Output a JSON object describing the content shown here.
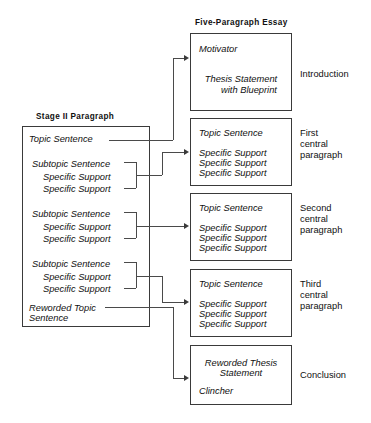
{
  "diagram": {
    "title_left": "Stage II Paragraph",
    "title_right": "Five-Paragraph Essay"
  },
  "stage_paragraph": {
    "topic_sentence": "Topic Sentence",
    "groups": [
      {
        "subtopic": "Subtopic Sentence",
        "support_1": "Specific Support",
        "support_2": "Specific Support"
      },
      {
        "subtopic": "Subtopic Sentence",
        "support_1": "Specific Support",
        "support_2": "Specific Support"
      },
      {
        "subtopic": "Subtopic Sentence",
        "support_1": "Specific Support",
        "support_2": "Specific Support"
      }
    ],
    "reworded_line_1": "Reworded Topic",
    "reworded_line_2": "Sentence"
  },
  "essay": {
    "boxes": [
      {
        "line_1": "Motivator",
        "line_2": "Thesis Statement",
        "line_3": "with Blueprint",
        "label": "Introduction"
      },
      {
        "line_1": "Topic Sentence",
        "line_2": "Specific Support",
        "line_3": "Specific Support",
        "line_4": "Specific Support",
        "label_1": "First",
        "label_2": "central",
        "label_3": "paragraph"
      },
      {
        "line_1": "Topic Sentence",
        "line_2": "Specific Support",
        "line_3": "Specific Support",
        "line_4": "Specific Support",
        "label_1": "Second",
        "label_2": "central",
        "label_3": "paragraph"
      },
      {
        "line_1": "Topic Sentence",
        "line_2": "Specific Support",
        "line_3": "Specific Support",
        "line_4": "Specific Support",
        "label_1": "Third",
        "label_2": "central",
        "label_3": "paragraph"
      },
      {
        "line_1": "Reworded Thesis",
        "line_2": "Statement",
        "line_3": "Clincher",
        "label": "Conclusion"
      }
    ]
  },
  "colors": {
    "ink": "#111111",
    "rule": "#3a3a3a",
    "paper": "#ffffff"
  }
}
